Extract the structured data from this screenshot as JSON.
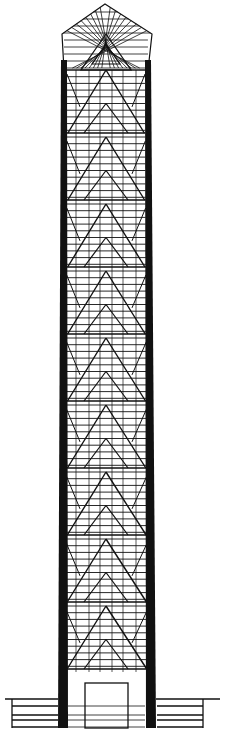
{
  "figure": {
    "type": "architectural-elevation",
    "canvas": {
      "width": 225,
      "height": 741
    },
    "colors": {
      "ink": "#111111",
      "paper": "#ffffff"
    },
    "cap": {
      "apex": [
        105,
        4
      ],
      "shoulder_left": [
        62,
        34
      ],
      "shoulder_right": [
        152,
        34
      ],
      "base_y": 70
    },
    "columns": {
      "left": {
        "top_x": 64,
        "bottom_x": 63,
        "width_top": 6,
        "width_bottom": 10
      },
      "right": {
        "top_x": 148,
        "bottom_x": 151,
        "width_top": 6,
        "width_bottom": 10
      },
      "top_y": 60,
      "bottom_y": 728
    },
    "modules": {
      "first_apex_y": 70,
      "count": 9,
      "spacing": 67,
      "center_x": 106
    },
    "base": {
      "door": {
        "x": 85,
        "y": 683,
        "w": 43,
        "h": 45
      },
      "ground_y": 699,
      "ground_left_x": 5,
      "ground_right_x": 220
    },
    "caption": ""
  }
}
